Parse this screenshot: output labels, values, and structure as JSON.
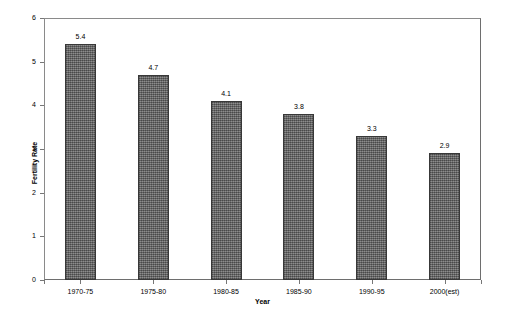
{
  "chart_data": {
    "type": "bar",
    "title": "",
    "xlabel": "Year",
    "ylabel": "Fertility Rate",
    "categories": [
      "1970-75",
      "1975-80",
      "1980-85",
      "1985-90",
      "1990-95",
      "2000(est)"
    ],
    "values": [
      5.4,
      4.7,
      4.1,
      3.8,
      3.3,
      2.9
    ],
    "value_labels": [
      "5.4",
      "4.7",
      "4.1",
      "3.8",
      "3.3",
      "2.9"
    ],
    "ylim": [
      0,
      6
    ],
    "ytick_labels": [
      "0",
      "1",
      "2",
      "3",
      "4",
      "5",
      "6"
    ],
    "ytick_values": [
      0,
      1,
      2,
      3,
      4,
      5,
      6
    ],
    "grid": false,
    "legend": false,
    "legend_position": "none",
    "series": [
      {
        "name": "Fertility Rate",
        "values": [
          5.4,
          4.7,
          4.1,
          3.8,
          3.3,
          2.9
        ],
        "color": "#6e6e6e",
        "edge_color": "#383838"
      }
    ],
    "colors": {
      "bar_fill": "#6e6e6e",
      "bar_edge": "#383838",
      "axis": "#808080",
      "text": "#000000",
      "background": "#ffffff"
    }
  }
}
